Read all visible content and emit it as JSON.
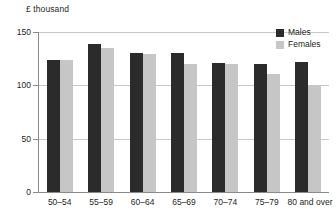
{
  "chart_data": {
    "type": "bar",
    "title": "",
    "subtitle": "",
    "unit_caption": "£ thousand",
    "xlabel": "",
    "ylabel": "",
    "categories": [
      "50–54",
      "55–59",
      "60–64",
      "65–69",
      "70–74",
      "75–79",
      "80 and over"
    ],
    "series": [
      {
        "name": "Males",
        "color": "#2b2b2b",
        "values": [
          124,
          139,
          130,
          130,
          121,
          120,
          122
        ]
      },
      {
        "name": "Females",
        "color": "#c6c6c6",
        "values": [
          124,
          135,
          129,
          120,
          120,
          111,
          100
        ]
      }
    ],
    "ylim": [
      0,
      150
    ],
    "yticks": [
      0,
      50,
      100,
      150
    ],
    "ytick_labels": [
      "0",
      "50",
      "100",
      "150"
    ],
    "grid": true,
    "grid_axis": "y",
    "legend_position": "top-right",
    "bar_group_count": 7,
    "bars_per_group": 2
  },
  "legend": {
    "items": [
      {
        "label": "Males",
        "swatch": "males-swatch"
      },
      {
        "label": "Females",
        "swatch": "females-swatch"
      }
    ]
  },
  "colors": {
    "males": "#2b2b2b",
    "females": "#c6c6c6",
    "gridline": "#c9c9c9",
    "axis": "#8a8a8a",
    "text": "#231f20",
    "background": "#ffffff"
  }
}
